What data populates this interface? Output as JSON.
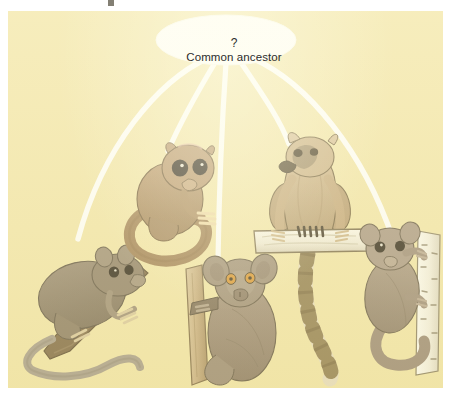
{
  "figure": {
    "type": "diagram",
    "background_color": "#f2e5a9",
    "panel": {
      "x": 8,
      "y": 11,
      "width": 435,
      "height": 377
    }
  },
  "ancestor_node": {
    "question_mark": "?",
    "label": "Common ancestor",
    "shape": "ellipse",
    "fill": "#ffffff",
    "text_color": "#2c2c2c",
    "center": {
      "x": 226,
      "y": 40
    },
    "rx": 70,
    "ry": 25
  },
  "branches": {
    "count": 5,
    "color": "#ffffff",
    "width_px": 5,
    "style": "curved radiating lines",
    "endpoints": [
      {
        "id": "branch-1",
        "to": "tarsier-on-diagonal-branch",
        "x": 78,
        "y": 238
      },
      {
        "id": "branch-2",
        "to": "brown-mouse-lemur",
        "x": 168,
        "y": 148
      },
      {
        "id": "branch-3",
        "to": "grey-lemur-on-trunk",
        "x": 218,
        "y": 258
      },
      {
        "id": "branch-4",
        "to": "ring-tailed-lemur",
        "x": 288,
        "y": 140
      },
      {
        "id": "branch-5",
        "to": "lemur-on-white-trunk",
        "x": 392,
        "y": 236
      }
    ]
  },
  "animals": [
    {
      "id": "animal-1",
      "name": "tarsier-on-diagonal-branch",
      "description": "Greyish-brown primate with long naked tail clinging to a diagonal brown branch",
      "body_color": "#8a7a63",
      "tail_color": "#a79c8c",
      "perch": "diagonal brown branch",
      "perch_color": "#7d6647",
      "box": {
        "x": 22,
        "y": 238,
        "width": 115,
        "height": 128
      }
    },
    {
      "id": "animal-2",
      "name": "brown-mouse-lemur",
      "description": "Tan-brown primate with very large dark eyes and a long curled tail, seated",
      "body_color": "#ab8a5f",
      "eye_color": "#2b2118",
      "perch": "none",
      "box": {
        "x": 124,
        "y": 140,
        "width": 96,
        "height": 120
      }
    },
    {
      "id": "animal-3",
      "name": "grey-lemur-on-trunk",
      "description": "Grey-brown lemur with large rounded ears and orange eyes clinging to a tan vertical trunk",
      "body_color": "#9b8a76",
      "eye_color": "#d9932f",
      "perch": "tan vertical trunk",
      "perch_color": "#c8ab84",
      "box": {
        "x": 170,
        "y": 248,
        "width": 106,
        "height": 134
      }
    },
    {
      "id": "animal-4",
      "name": "ring-tailed-lemur",
      "description": "Ring-tailed lemur seated upright on a pale horizontal log, long black-and-white banded tail hanging down",
      "body_color": "#c2a478",
      "tail_bands": "alternating cream and dark brown rings",
      "perch": "pale horizontal log",
      "perch_color": "#f0ece0",
      "box": {
        "x": 250,
        "y": 132,
        "width": 110,
        "height": 232
      }
    },
    {
      "id": "animal-5",
      "name": "lemur-on-white-trunk",
      "description": "Grey-brown lemur with curled tail clinging to a white birch-like vertical trunk",
      "body_color": "#9c8a78",
      "perch": "white birch trunk with dark speckles",
      "perch_color": "#f6f4ec",
      "box": {
        "x": 358,
        "y": 222,
        "width": 82,
        "height": 146
      }
    }
  ]
}
